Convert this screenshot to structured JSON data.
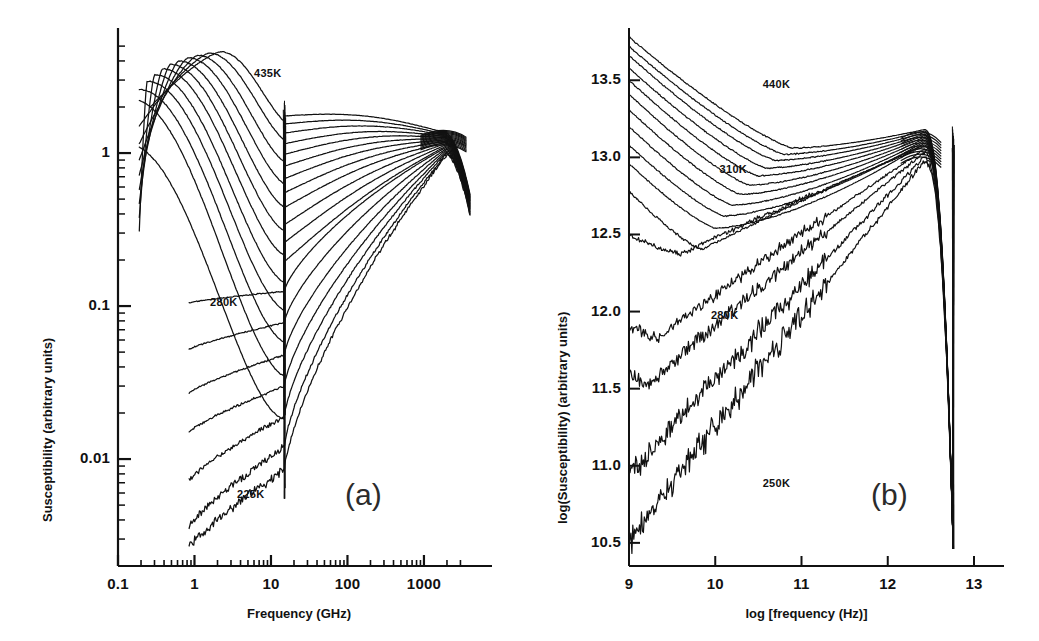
{
  "figure": {
    "background": "#ffffff",
    "ink": "#111111",
    "panel_label_color": "#2b2b2b"
  },
  "panels": [
    {
      "id": "a",
      "label": "(a)",
      "xlabel": "Frequency (GHz)",
      "ylabel": "Susceptibility (arbitrary units)",
      "xticks": [
        "0.1",
        "1",
        "10",
        "100",
        "1000"
      ],
      "yticks": [
        "1",
        "0.1",
        "0.01"
      ],
      "annotations": [
        "435K",
        "280K",
        "225K"
      ]
    },
    {
      "id": "b",
      "label": "(b)",
      "xlabel": "log [frequency (Hz)]",
      "ylabel": "log(Susceptibility) (arbitrary units)",
      "xticks": [
        "9",
        "10",
        "11",
        "12",
        "13"
      ],
      "yticks": [
        "13.5",
        "13.0",
        "12.5",
        "12.0",
        "11.5",
        "11.0",
        "10.5"
      ],
      "annotations": [
        "440K",
        "310K",
        "280K",
        "250K"
      ]
    }
  ],
  "chart_data": [
    {
      "type": "line",
      "panel": "a",
      "title": "",
      "xlabel": "Frequency (GHz)",
      "ylabel": "Susceptibility (arbitrary units)",
      "xscale": "log",
      "yscale": "log",
      "xlim": [
        0.1,
        4000
      ],
      "ylim": [
        0.002,
        6.0
      ],
      "xticks": [
        0.1,
        1,
        10,
        100,
        1000
      ],
      "xticklabels": [
        "0.1",
        "1",
        "10",
        "100",
        "1000"
      ],
      "yticks": [
        1,
        0.1,
        0.01
      ],
      "yticklabels": [
        "1",
        "0.1",
        "0.01"
      ],
      "grid": false,
      "legend": "none",
      "annotations": [
        {
          "text": "435K",
          "x": 6.0,
          "y": 3.3
        },
        {
          "text": "280K",
          "x": 1.6,
          "y": 0.105
        },
        {
          "text": "225K",
          "x": 3.6,
          "y": 0.0058
        }
      ],
      "notes": "Susceptibility spectra of a glass former vs frequency at a sequence of temperatures. Alpha-relaxation peak shifts to higher frequency with increasing temperature; all curves pass through a narrow common notch near 15 GHz and merge into a boson-peak bundle near 2000 GHz.",
      "series": [
        {
          "name": "435K",
          "temperature_K": 435,
          "peak_freq_GHz": 2.2,
          "peak_value": 4.6,
          "low_f_value": 2.0,
          "notch_value": 1.75,
          "boson_value": 1.35
        },
        {
          "name": "420K",
          "temperature_K": 420,
          "peak_freq_GHz": 1.55,
          "peak_value": 4.5,
          "low_f_value": 1.5,
          "notch_value": 1.55,
          "boson_value": 1.32
        },
        {
          "name": "405K",
          "temperature_K": 405,
          "peak_freq_GHz": 1.1,
          "peak_value": 4.35,
          "low_f_value": 1.15,
          "notch_value": 1.35,
          "boson_value": 1.3
        },
        {
          "name": "390K",
          "temperature_K": 390,
          "peak_freq_GHz": 0.82,
          "peak_value": 4.2,
          "low_f_value": 0.9,
          "notch_value": 1.15,
          "boson_value": 1.28
        },
        {
          "name": "375K",
          "temperature_K": 375,
          "peak_freq_GHz": 0.62,
          "peak_value": 4.0,
          "low_f_value": 0.72,
          "notch_value": 0.98,
          "boson_value": 1.26
        },
        {
          "name": "360K",
          "temperature_K": 360,
          "peak_freq_GHz": 0.48,
          "peak_value": 3.8,
          "low_f_value": 0.58,
          "notch_value": 0.82,
          "boson_value": 1.24
        },
        {
          "name": "345K",
          "temperature_K": 345,
          "peak_freq_GHz": 0.38,
          "peak_value": 3.55,
          "low_f_value": 0.47,
          "notch_value": 0.68,
          "boson_value": 1.22
        },
        {
          "name": "330K",
          "temperature_K": 330,
          "peak_freq_GHz": 0.3,
          "peak_value": 3.25,
          "low_f_value": 0.38,
          "notch_value": 0.55,
          "boson_value": 1.2
        },
        {
          "name": "320K",
          "temperature_K": 320,
          "peak_freq_GHz": 0.24,
          "peak_value": 2.95,
          "low_f_value": 0.31,
          "notch_value": 0.44,
          "boson_value": 1.18
        },
        {
          "name": "310K",
          "temperature_K": 310,
          "peak_freq_GHz": 0.19,
          "peak_value": 2.6,
          "low_f_value": 0.26,
          "notch_value": 0.34,
          "boson_value": 1.16
        },
        {
          "name": "300K",
          "temperature_K": 300,
          "peak_freq_GHz": 0.15,
          "peak_value": 2.25,
          "low_f_value": 0.215,
          "notch_value": 0.26,
          "boson_value": 1.14
        },
        {
          "name": "290K",
          "temperature_K": 290,
          "peak_freq_GHz": 0.13,
          "peak_value": 1.15,
          "low_f_value": 0.165,
          "notch_value": 0.195,
          "boson_value": 1.12
        },
        {
          "name": "280K",
          "temperature_K": 280,
          "peak_freq_GHz": 0.12,
          "peak_value": 0.4,
          "low_f_value": 0.105,
          "notch_value": 0.125,
          "boson_value": 1.1
        },
        {
          "name": "270K",
          "temperature_K": 270,
          "peak_freq_GHz": 0.11,
          "peak_value": 0.2,
          "low_f_value": 0.052,
          "notch_value": 0.078,
          "boson_value": 1.08
        },
        {
          "name": "260K",
          "temperature_K": 260,
          "peak_freq_GHz": 0.1,
          "peak_value": 0.12,
          "low_f_value": 0.027,
          "notch_value": 0.048,
          "boson_value": 1.06
        },
        {
          "name": "250K",
          "temperature_K": 250,
          "peak_freq_GHz": 0.1,
          "peak_value": 0.07,
          "low_f_value": 0.015,
          "notch_value": 0.03,
          "boson_value": 1.04
        },
        {
          "name": "240K",
          "temperature_K": 240,
          "peak_freq_GHz": 0.1,
          "peak_value": 0.04,
          "low_f_value": 0.0072,
          "notch_value": 0.019,
          "boson_value": 1.02
        },
        {
          "name": "232K",
          "temperature_K": 232,
          "peak_freq_GHz": 0.1,
          "peak_value": 0.02,
          "low_f_value": 0.0036,
          "notch_value": 0.012,
          "boson_value": 1.0
        },
        {
          "name": "225K",
          "temperature_K": 225,
          "peak_freq_GHz": 0.1,
          "peak_value": 0.01,
          "low_f_value": 0.0026,
          "notch_value": 0.0085,
          "boson_value": 0.98
        }
      ]
    },
    {
      "type": "line",
      "panel": "b",
      "title": "",
      "xlabel": "log [frequency (Hz)]",
      "ylabel": "log(Susceptibility) (arbitrary units)",
      "xscale": "linear",
      "yscale": "linear",
      "xlim": [
        9,
        13
      ],
      "ylim": [
        10.35,
        13.8
      ],
      "xticks": [
        9,
        10,
        11,
        12,
        13
      ],
      "xticklabels": [
        "9",
        "10",
        "11",
        "12",
        "13"
      ],
      "yticks": [
        13.5,
        13.0,
        12.5,
        12.0,
        11.5,
        11.0,
        10.5
      ],
      "yticklabels": [
        "13.5",
        "13.0",
        "12.5",
        "12.0",
        "11.5",
        "11.0",
        "10.5"
      ],
      "grid": false,
      "legend": "none",
      "annotations": [
        {
          "text": "440K",
          "x": 10.55,
          "y": 13.47
        },
        {
          "text": "310K",
          "x": 10.05,
          "y": 12.92
        },
        {
          "text": "280K",
          "x": 9.95,
          "y": 11.97
        },
        {
          "text": "250K",
          "x": 10.55,
          "y": 10.88
        }
      ],
      "notes": "Same data plotted as log-susceptibility versus log-frequency. Minima deepen and move to lower frequency as temperature drops; all curves converge to a boson peak near log f = 12.4 followed by a sharp cutoff at log f = 12.75.",
      "series": [
        {
          "name": "440K",
          "temperature_K": 440,
          "start_value": 13.78,
          "min_logf": 10.9,
          "min_value": 13.06,
          "boson_value": 13.18
        },
        {
          "name": "430K",
          "temperature_K": 430,
          "start_value": 13.72,
          "min_logf": 10.8,
          "min_value": 13.02,
          "boson_value": 13.17
        },
        {
          "name": "415K",
          "temperature_K": 415,
          "start_value": 13.66,
          "min_logf": 10.7,
          "min_value": 12.98,
          "boson_value": 13.16
        },
        {
          "name": "400K",
          "temperature_K": 400,
          "start_value": 13.58,
          "min_logf": 10.6,
          "min_value": 12.93,
          "boson_value": 13.15
        },
        {
          "name": "385K",
          "temperature_K": 385,
          "start_value": 13.5,
          "min_logf": 10.5,
          "min_value": 12.88,
          "boson_value": 13.14
        },
        {
          "name": "370K",
          "temperature_K": 370,
          "start_value": 13.41,
          "min_logf": 10.4,
          "min_value": 12.82,
          "boson_value": 13.13
        },
        {
          "name": "355K",
          "temperature_K": 355,
          "start_value": 13.31,
          "min_logf": 10.3,
          "min_value": 12.76,
          "boson_value": 13.12
        },
        {
          "name": "340K",
          "temperature_K": 340,
          "start_value": 13.2,
          "min_logf": 10.2,
          "min_value": 12.69,
          "boson_value": 13.11
        },
        {
          "name": "325K",
          "temperature_K": 325,
          "start_value": 13.08,
          "min_logf": 10.1,
          "min_value": 12.62,
          "boson_value": 13.1
        },
        {
          "name": "310K",
          "temperature_K": 310,
          "start_value": 12.96,
          "min_logf": 10.0,
          "min_value": 12.54,
          "boson_value": 13.09
        },
        {
          "name": "295K",
          "temperature_K": 295,
          "start_value": 12.78,
          "min_logf": 9.85,
          "min_value": 12.4,
          "boson_value": 13.08
        },
        {
          "name": "285K",
          "temperature_K": 285,
          "start_value": 12.5,
          "min_logf": 9.6,
          "min_value": 12.37,
          "boson_value": 13.07
        },
        {
          "name": "280K",
          "temperature_K": 280,
          "start_value": 11.9,
          "min_logf": 9.35,
          "min_value": 11.83,
          "boson_value": 13.05
        },
        {
          "name": "270K",
          "temperature_K": 270,
          "start_value": 11.6,
          "min_logf": 9.25,
          "min_value": 11.53,
          "boson_value": 13.03
        },
        {
          "name": "260K",
          "temperature_K": 260,
          "start_value": 11.02,
          "min_logf": 9.1,
          "min_value": 10.98,
          "boson_value": 13.0
        },
        {
          "name": "250K",
          "temperature_K": 250,
          "start_value": 10.58,
          "min_logf": 9.05,
          "min_value": 10.52,
          "boson_value": 12.97
        }
      ]
    }
  ]
}
